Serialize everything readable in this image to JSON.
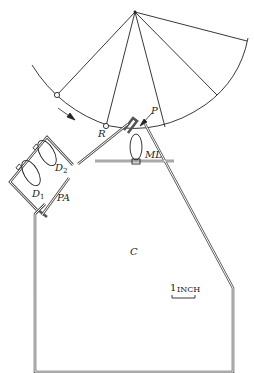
{
  "labels": {
    "R": "R",
    "P": "P",
    "ML": "ML",
    "D1_main": "D",
    "D1_sub": "1",
    "D2_main": "D",
    "D2_sub": "2",
    "PA": "PA",
    "C": "C"
  },
  "scale_bar": {
    "number": "1",
    "unit": "INCH"
  },
  "colors": {
    "line": "#222222",
    "wall": "#555555",
    "background": "#ffffff"
  }
}
